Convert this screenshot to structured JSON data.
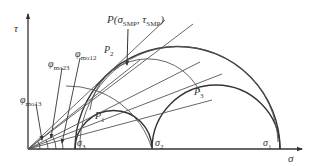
{
  "diagram": {
    "type": "mohr-circle-smp",
    "axes": {
      "x_label": "σ",
      "y_label": "τ"
    },
    "principal_stresses": [
      {
        "label": "σ",
        "sub": "3",
        "x": 75
      },
      {
        "label": "σ",
        "sub": "2",
        "x": 152
      },
      {
        "label": "σ",
        "sub": "1",
        "x": 280
      }
    ],
    "points": [
      {
        "label": "P",
        "sub": "1"
      },
      {
        "label": "P",
        "sub": "2"
      },
      {
        "label": "P",
        "sub": "3"
      }
    ],
    "smp_point": {
      "prefix": "P(",
      "sigma": "σ",
      "sigma_sub": "SMP",
      "sep": ", ",
      "tau": "τ",
      "tau_sub": "SMP",
      "suffix": ")"
    },
    "angles": [
      {
        "symbol": "φ",
        "sub": "mo13"
      },
      {
        "symbol": "φ",
        "sub": "mo23"
      },
      {
        "symbol": "φ",
        "sub": "mo12"
      }
    ],
    "colors": {
      "line": "#333333",
      "thin_line": "#555555",
      "background": "#ffffff"
    }
  }
}
